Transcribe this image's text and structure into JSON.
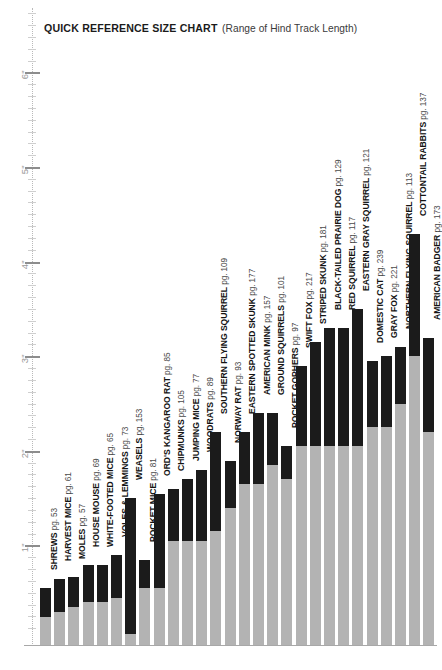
{
  "title": {
    "main": "QUICK REFERENCE SIZE CHART",
    "sub": "(Range of Hind Track Length)"
  },
  "axis": {
    "unit": "inch",
    "tick_labels": [
      "1\"",
      "2\"",
      "3\"",
      "4\"",
      "5\"",
      "6\""
    ],
    "tick_values": [
      1,
      2,
      3,
      4,
      5,
      6
    ],
    "minor_step": 0.125
  },
  "colors": {
    "bar_min_range": "#b3b3b3",
    "bar_max_range": "#1b1b1b",
    "baseline": "#a8a8a8",
    "axis_rule": "#b9b9b9",
    "tick_major": "#8d8d8d",
    "tick_label": "#9a9a9a",
    "text": "#1b1b1b",
    "page_label_text": "#4a4a4a",
    "background": "#ffffff"
  },
  "chart_data": {
    "type": "bar",
    "title": "QUICK REFERENCE SIZE CHART (Range of Hind Track Length)",
    "xlabel": "",
    "ylabel": "Hind Track Length (inches)",
    "ylim": [
      0,
      6.5
    ],
    "grid": false,
    "legend": null,
    "note": "Each bar is a floating range: gray portion spans 0 to the minimum hind track length, black portion spans minimum to maximum hind track length.",
    "categories": [
      "SHREWS",
      "HARVEST MICE",
      "MOLES",
      "HOUSE MOUSE",
      "WHITE-FOOTED MICE",
      "VOLES & LEMMINGS",
      "WEASELS",
      "POCKET MICE",
      "ORD'S KANGAROO RAT",
      "CHIPMUNKS",
      "JUMPING MICE",
      "WOODRATS",
      "SOUTHERN FLYING SQUIRREL",
      "NORWAY RAT",
      "EASTERN SPOTTED SKUNK",
      "AMERICAN MINK",
      "GROUND SQUIRRELS",
      "POCKET GOPHERS",
      "SWIFT FOX",
      "STRIPED SKUNK",
      "BLACK-TAILED PRAIRIE DOG",
      "RED SQUIRREL",
      "EASTERN GRAY SQUIRREL",
      "DOMESTIC CAT",
      "GRAY FOX",
      "NORTHERN FLYING SQUIRREL",
      "COTTONTAIL RABBITS",
      "AMERICAN BADGER"
    ],
    "pages": [
      53,
      61,
      57,
      69,
      65,
      73,
      153,
      81,
      85,
      105,
      77,
      89,
      109,
      93,
      177,
      157,
      101,
      97,
      217,
      181,
      129,
      117,
      121,
      239,
      221,
      113,
      137,
      173
    ],
    "series": [
      {
        "name": "Minimum hind track length (in)",
        "values": [
          0.3,
          0.35,
          0.4,
          0.45,
          0.45,
          0.5,
          0.12,
          0.6,
          0.6,
          1.1,
          1.1,
          1.1,
          1.2,
          1.45,
          1.7,
          1.7,
          1.9,
          1.75,
          2.1,
          2.1,
          2.1,
          2.1,
          2.1,
          2.3,
          2.3,
          2.55,
          3.05,
          2.25
        ]
      },
      {
        "name": "Maximum hind track length (in)",
        "values": [
          0.6,
          0.7,
          0.72,
          0.85,
          0.85,
          0.95,
          1.55,
          0.9,
          1.6,
          1.65,
          1.75,
          1.85,
          2.25,
          1.95,
          2.25,
          2.45,
          2.45,
          2.1,
          2.95,
          3.2,
          3.35,
          3.35,
          3.55,
          3.0,
          3.05,
          3.15,
          4.35,
          3.25
        ]
      }
    ],
    "labels": [
      {
        "name": "SHREWS",
        "page": 53,
        "min": 0.3,
        "max": 0.6
      },
      {
        "name": "HARVEST MICE",
        "page": 61,
        "min": 0.35,
        "max": 0.7
      },
      {
        "name": "MOLES",
        "page": 57,
        "min": 0.4,
        "max": 0.72
      },
      {
        "name": "HOUSE MOUSE",
        "page": 69,
        "min": 0.45,
        "max": 0.85
      },
      {
        "name": "WHITE-FOOTED MICE",
        "page": 65,
        "min": 0.45,
        "max": 0.85
      },
      {
        "name": "VOLES & LEMMINGS",
        "page": 73,
        "min": 0.5,
        "max": 0.95
      },
      {
        "name": "WEASELS",
        "page": 153,
        "min": 0.12,
        "max": 1.55
      },
      {
        "name": "POCKET MICE",
        "page": 81,
        "min": 0.6,
        "max": 0.9
      },
      {
        "name": "ORD'S KANGAROO RAT",
        "page": 85,
        "min": 0.6,
        "max": 1.6
      },
      {
        "name": "CHIPMUNKS",
        "page": 105,
        "min": 1.1,
        "max": 1.65
      },
      {
        "name": "JUMPING MICE",
        "page": 77,
        "min": 1.1,
        "max": 1.75
      },
      {
        "name": "WOODRATS",
        "page": 89,
        "min": 1.1,
        "max": 1.85
      },
      {
        "name": "SOUTHERN FLYING SQUIRREL",
        "page": 109,
        "min": 1.2,
        "max": 2.25
      },
      {
        "name": "NORWAY RAT",
        "page": 93,
        "min": 1.45,
        "max": 1.95
      },
      {
        "name": "EASTERN SPOTTED SKUNK",
        "page": 177,
        "min": 1.7,
        "max": 2.25
      },
      {
        "name": "AMERICAN MINK",
        "page": 157,
        "min": 1.7,
        "max": 2.45
      },
      {
        "name": "GROUND SQUIRRELS",
        "page": 101,
        "min": 1.9,
        "max": 2.45
      },
      {
        "name": "POCKET GOPHERS",
        "page": 97,
        "min": 1.75,
        "max": 2.1
      },
      {
        "name": "SWIFT FOX",
        "page": 217,
        "min": 2.1,
        "max": 2.95
      },
      {
        "name": "STRIPED SKUNK",
        "page": 181,
        "min": 2.1,
        "max": 3.2
      },
      {
        "name": "BLACK-TAILED PRAIRIE DOG",
        "page": 129,
        "min": 2.1,
        "max": 3.35
      },
      {
        "name": "RED SQUIRREL",
        "page": 117,
        "min": 2.1,
        "max": 3.35
      },
      {
        "name": "EASTERN GRAY SQUIRREL",
        "page": 121,
        "min": 2.1,
        "max": 3.55
      },
      {
        "name": "DOMESTIC CAT",
        "page": 239,
        "min": 2.3,
        "max": 3.0
      },
      {
        "name": "GRAY FOX",
        "page": 221,
        "min": 2.3,
        "max": 3.05
      },
      {
        "name": "NORTHERN FLYING SQUIRREL",
        "page": 113,
        "min": 2.55,
        "max": 3.15
      },
      {
        "name": "COTTONTAIL RABBITS",
        "page": 137,
        "min": 3.05,
        "max": 4.35
      },
      {
        "name": "AMERICAN BADGER",
        "page": 173,
        "min": 2.25,
        "max": 3.25
      }
    ]
  },
  "layout": {
    "bar_width_px": 11,
    "bar_pitch_px": 14.2,
    "first_bar_left_px": 40,
    "baseline_y_px": 645,
    "px_per_inch": 94.6,
    "axis_zero_y_px": 640
  }
}
